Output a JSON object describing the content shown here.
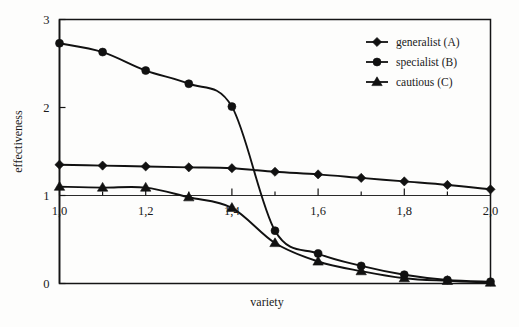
{
  "chart_data": {
    "type": "line",
    "title": "",
    "xlabel": "variety",
    "ylabel": "effectiveness",
    "xlim": [
      1.0,
      2.0
    ],
    "ylim": [
      0,
      3
    ],
    "grid": false,
    "legend_position": "top-right",
    "x": [
      1.0,
      1.1,
      1.2,
      1.3,
      1.4,
      1.5,
      1.6,
      1.7,
      1.8,
      1.9,
      2.0
    ],
    "xticks": [
      1.0,
      1.2,
      1.4,
      1.6,
      1.8,
      2.0
    ],
    "xtick_labels": [
      "1,0",
      "1,2",
      "1,4",
      "1,6",
      "1,8",
      "2,0"
    ],
    "yticks": [
      0,
      1,
      2,
      3
    ],
    "ytick_labels": [
      "0",
      "1",
      "2",
      "3"
    ],
    "series": [
      {
        "name": "generalist (A)",
        "marker": "diamond",
        "values": [
          1.35,
          1.34,
          1.33,
          1.32,
          1.31,
          1.27,
          1.24,
          1.2,
          1.16,
          1.12,
          1.07
        ]
      },
      {
        "name": "specialist (B)",
        "marker": "circle",
        "values": [
          2.73,
          2.63,
          2.42,
          2.27,
          2.01,
          0.6,
          0.34,
          0.2,
          0.1,
          0.04,
          0.02
        ]
      },
      {
        "name": "cautious  (C)",
        "marker": "triangle",
        "values": [
          1.1,
          1.09,
          1.09,
          0.98,
          0.86,
          0.46,
          0.25,
          0.14,
          0.06,
          0.03,
          0.01
        ]
      }
    ]
  },
  "legend": {
    "items": [
      {
        "label": "generalist (A)",
        "marker": "diamond"
      },
      {
        "label": "specialist (B)",
        "marker": "circle"
      },
      {
        "label": "cautious  (C)",
        "marker": "triangle"
      }
    ]
  },
  "axes": {
    "x_title": "variety",
    "y_title": "effectiveness"
  }
}
